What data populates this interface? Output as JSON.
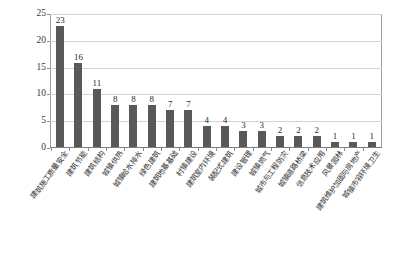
{
  "chart_data": {
    "type": "bar",
    "title": "",
    "subtitle": "",
    "xlabel": "",
    "ylabel": "",
    "ylim": [
      0,
      25
    ],
    "yticks": [
      0,
      5,
      10,
      15,
      20,
      25
    ],
    "grid": true,
    "legend": false,
    "orientation": "vertical",
    "bar_color": "#595959",
    "plot_border_color": "#9b9b9b",
    "gridline_color": "#d4d4d4",
    "categories": [
      "建筑施工质量安全",
      "建筑节能",
      "建筑结构",
      "城镇供热",
      "城镇给水排水",
      "绿色建筑",
      "建筑地基基础",
      "村镇建设",
      "建筑室内环境",
      "装配式建筑",
      "建设管理",
      "城镇燃气",
      "城市与工程防灾",
      "城镇道路桥梁",
      "信息技术应用",
      "风景园林",
      "建筑维护加固与房地产",
      "城镇市容环境卫生"
    ],
    "values": [
      23,
      16,
      11,
      8,
      8,
      8,
      7,
      7,
      4,
      4,
      3,
      3,
      2,
      2,
      2,
      1,
      1,
      1
    ],
    "data_labels": [
      "23",
      "16",
      "11",
      "8",
      "8",
      "8",
      "7",
      "7",
      "4",
      "4",
      "3",
      "3",
      "2",
      "2",
      "2",
      "1",
      "1",
      "1"
    ],
    "ytick_labels": [
      "0",
      "5",
      "10",
      "15",
      "20",
      "25"
    ]
  }
}
